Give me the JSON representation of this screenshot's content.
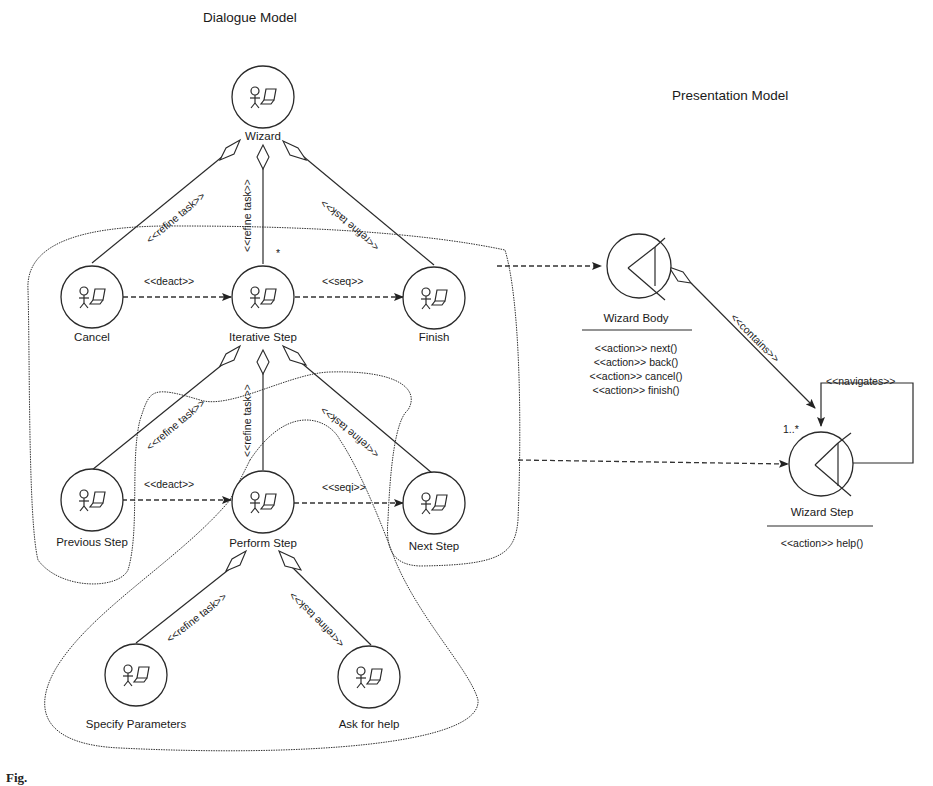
{
  "titles": {
    "dialogue_model": "Dialogue Model",
    "presentation_model": "Presentation Model"
  },
  "dialogue_nodes": {
    "wizard": {
      "label": "Wizard",
      "icon": "user-computer-task-icon"
    },
    "cancel": {
      "label": "Cancel",
      "icon": "user-computer-task-icon"
    },
    "iterative_step": {
      "label": "Iterative Step",
      "icon": "user-computer-task-icon"
    },
    "finish": {
      "label": "Finish",
      "icon": "user-computer-task-icon"
    },
    "previous_step": {
      "label": "Previous Step",
      "icon": "user-computer-task-icon"
    },
    "perform_step": {
      "label": "Perform Step",
      "icon": "user-computer-task-icon"
    },
    "next_step": {
      "label": "Next Step",
      "icon": "user-computer-task-icon"
    },
    "specify_parameters": {
      "label": "Specify Parameters",
      "icon": "user-computer-task-icon"
    },
    "ask_for_help": {
      "label": "Ask for help",
      "icon": "user-computer-task-icon"
    }
  },
  "dialogue_edges": {
    "wizard_cancel": "<<refine task>>",
    "wizard_iterative": "<<refine task>>",
    "wizard_finish": "<<refine task>>",
    "cancel_iterative": "<<deact>>",
    "iterative_finish": "<<seq>>",
    "iterative_previous": "<<refine task>>",
    "iterative_perform": "<<refine task>>",
    "iterative_next": "<<refine task>>",
    "previous_perform": "<<deact>>",
    "perform_next": "<<seqi>>",
    "perform_specify": "<<refine task>>",
    "perform_ask": "<<refine task>>",
    "iterative_multiplicity": "*"
  },
  "presentation_nodes": {
    "wizard_body": {
      "label": "Wizard Body",
      "icon": "boundary-class-icon",
      "operations": [
        "<<action>> next()",
        "<<action>> back()",
        "<<action>> cancel()",
        "<<action>> finish()"
      ]
    },
    "wizard_step": {
      "label": "Wizard Step",
      "icon": "boundary-class-icon",
      "operations": [
        "<<action>> help()"
      ]
    }
  },
  "presentation_edges": {
    "contains": "<<contains>>",
    "contains_multiplicity": "1..*",
    "navigates": "<<navigates>>"
  },
  "caption": "Fig."
}
